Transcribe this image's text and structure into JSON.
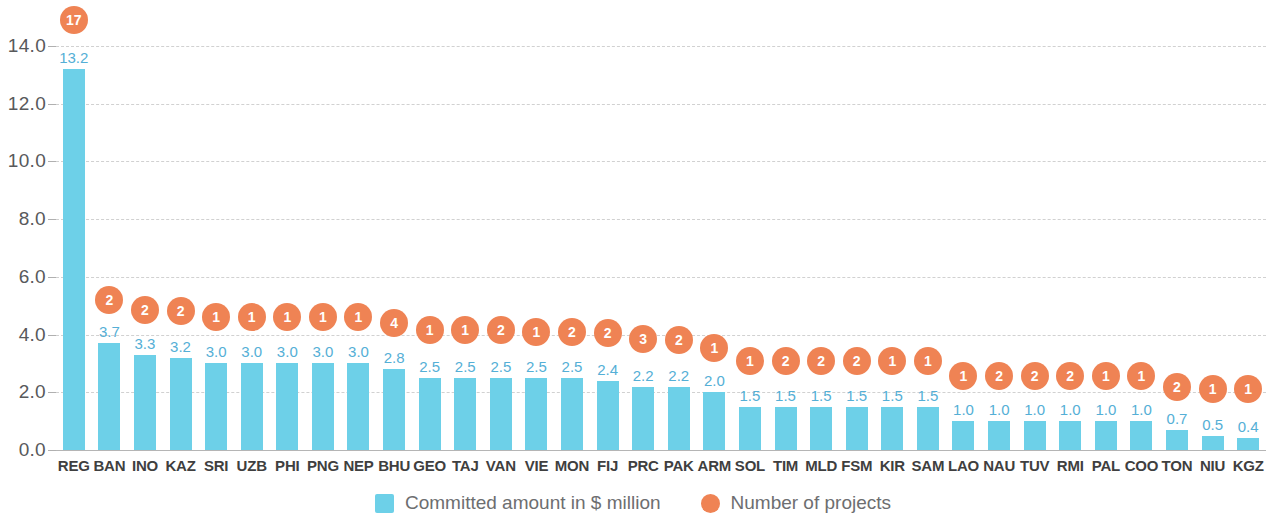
{
  "chart_data": {
    "type": "bar",
    "title": "",
    "subtitle": "",
    "xlabel": "",
    "ylabel": "",
    "ylim": [
      0.0,
      14.0
    ],
    "y_ticks": [
      "0.0",
      "2.0",
      "4.0",
      "6.0",
      "8.0",
      "10.0",
      "12.0",
      "14.0"
    ],
    "y_tick_values": [
      0.0,
      2.0,
      4.0,
      6.0,
      8.0,
      10.0,
      12.0,
      14.0
    ],
    "grid": "horizontal-dashed",
    "legend_position": "bottom-center",
    "categories": [
      "REG",
      "BAN",
      "INO",
      "KAZ",
      "SRI",
      "UZB",
      "PHI",
      "PNG",
      "NEP",
      "BHU",
      "GEO",
      "TAJ",
      "VAN",
      "VIE",
      "MON",
      "FIJ",
      "PRC",
      "PAK",
      "ARM",
      "SOL",
      "TIM",
      "MLD",
      "FSM",
      "KIR",
      "SAM",
      "LAO",
      "NAU",
      "TUV",
      "RMI",
      "PAL",
      "COO",
      "TON",
      "NIU",
      "KGZ"
    ],
    "series": [
      {
        "name": "Committed amount in $ million",
        "type": "bar",
        "color": "#6DD0E8",
        "values": [
          13.2,
          3.7,
          3.3,
          3.2,
          3.0,
          3.0,
          3.0,
          3.0,
          3.0,
          2.8,
          2.5,
          2.5,
          2.5,
          2.5,
          2.5,
          2.4,
          2.2,
          2.2,
          2.0,
          1.5,
          1.5,
          1.5,
          1.5,
          1.5,
          1.5,
          1.0,
          1.0,
          1.0,
          1.0,
          1.0,
          1.0,
          0.7,
          0.5,
          0.4
        ],
        "labels": [
          "13.2",
          "3.7",
          "3.3",
          "3.2",
          "3.0",
          "3.0",
          "3.0",
          "3.0",
          "3.0",
          "2.8",
          "2.5",
          "2.5",
          "2.5",
          "2.5",
          "2.5",
          "2.4",
          "2.2",
          "2.2",
          "2.0",
          "1.5",
          "1.5",
          "1.5",
          "1.5",
          "1.5",
          "1.5",
          "1.0",
          "1.0",
          "1.0",
          "1.0",
          "1.0",
          "1.0",
          "0.7",
          "0.5",
          "0.4"
        ]
      },
      {
        "name": "Number of projects",
        "type": "marker-circle",
        "color": "#EF8354",
        "values": [
          17,
          2,
          2,
          2,
          1,
          1,
          1,
          1,
          1,
          4,
          1,
          1,
          2,
          1,
          2,
          2,
          3,
          2,
          1,
          1,
          2,
          2,
          2,
          1,
          1,
          1,
          2,
          2,
          2,
          1,
          1,
          2,
          1,
          1
        ],
        "labels": [
          "17",
          "2",
          "2",
          "2",
          "1",
          "1",
          "1",
          "1",
          "1",
          "4",
          "1",
          "1",
          "2",
          "1",
          "2",
          "2",
          "3",
          "2",
          "1",
          "1",
          "2",
          "2",
          "2",
          "1",
          "1",
          "1",
          "2",
          "2",
          "2",
          "1",
          "1",
          "2",
          "1",
          "1"
        ],
        "marker_heights": [
          14.9,
          5.2,
          4.85,
          4.8,
          4.6,
          4.6,
          4.6,
          4.6,
          4.6,
          4.4,
          4.15,
          4.15,
          4.15,
          4.1,
          4.1,
          4.05,
          3.85,
          3.8,
          3.55,
          3.1,
          3.1,
          3.1,
          3.1,
          3.1,
          3.1,
          2.55,
          2.55,
          2.55,
          2.55,
          2.55,
          2.55,
          2.2,
          2.1,
          2.1
        ]
      }
    ]
  },
  "legend": {
    "items": [
      {
        "label": "Committed amount in $ million",
        "swatch": "square",
        "color": "#6DD0E8"
      },
      {
        "label": "Number of projects",
        "swatch": "circle",
        "color": "#EF8354"
      }
    ]
  },
  "colors": {
    "bar": "#6DD0E8",
    "marker": "#EF8354",
    "bar_value_label": "#55AFD6",
    "axis_text": "#58595b",
    "category_text": "#3f3f3f",
    "gridline": "#c9c9c9",
    "background": "#ffffff"
  }
}
